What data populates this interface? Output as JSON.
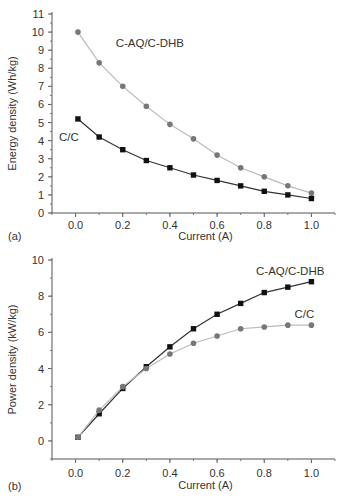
{
  "chart_data": [
    {
      "panel_label": "(a)",
      "type": "line",
      "title": "",
      "xlabel": "Current (A)",
      "ylabel": "Energy density (Wh/kg)",
      "xlim": [
        -0.1,
        1.1
      ],
      "ylim": [
        0,
        11
      ],
      "xticks": [
        "0.0",
        "0.2",
        "0.4",
        "0.6",
        "0.8",
        "1.0"
      ],
      "yticks": [
        "0",
        "1",
        "2",
        "3",
        "4",
        "5",
        "6",
        "7",
        "8",
        "9",
        "10",
        "11"
      ],
      "grid": false,
      "x": [
        0.01,
        0.1,
        0.2,
        0.3,
        0.4,
        0.5,
        0.6,
        0.7,
        0.8,
        0.9,
        1.0
      ],
      "series": [
        {
          "name": "C-AQ/C-DHB",
          "marker": "circle",
          "color": "#777777",
          "line_color": "#bbbbbb",
          "values": [
            10.0,
            8.3,
            7.0,
            5.9,
            4.9,
            4.1,
            3.2,
            2.5,
            2.0,
            1.5,
            1.1
          ],
          "label_pos": [
            0.17,
            9.4
          ]
        },
        {
          "name": "C/C",
          "marker": "square",
          "color": "#111111",
          "line_color": "#333333",
          "values": [
            5.2,
            4.2,
            3.5,
            2.9,
            2.5,
            2.1,
            1.8,
            1.5,
            1.2,
            1.0,
            0.8
          ],
          "label_pos": [
            -0.07,
            4.2
          ]
        }
      ]
    },
    {
      "panel_label": "(b)",
      "type": "line",
      "title": "",
      "xlabel": "Current (A)",
      "ylabel": "Power density (kW/kg)",
      "xlim": [
        -0.1,
        1.1
      ],
      "ylim": [
        -1,
        10
      ],
      "xticks": [
        "0.0",
        "0.2",
        "0.4",
        "0.6",
        "0.8",
        "1.0"
      ],
      "yticks": [
        "0",
        "2",
        "4",
        "6",
        "8",
        "10"
      ],
      "grid": false,
      "x": [
        0.01,
        0.1,
        0.2,
        0.3,
        0.4,
        0.5,
        0.6,
        0.7,
        0.8,
        0.9,
        1.0
      ],
      "series": [
        {
          "name": "C-AQ/C-DHB",
          "marker": "square",
          "color": "#111111",
          "line_color": "#333333",
          "values": [
            0.2,
            1.5,
            2.9,
            4.1,
            5.2,
            6.2,
            7.0,
            7.6,
            8.2,
            8.5,
            8.8
          ],
          "label_pos": [
            0.91,
            9.4
          ]
        },
        {
          "name": "C/C",
          "marker": "circle",
          "color": "#777777",
          "line_color": "#bbbbbb",
          "values": [
            0.2,
            1.7,
            3.0,
            4.0,
            4.8,
            5.4,
            5.8,
            6.2,
            6.3,
            6.4,
            6.4
          ],
          "label_pos": [
            0.97,
            7.0
          ]
        }
      ]
    }
  ]
}
